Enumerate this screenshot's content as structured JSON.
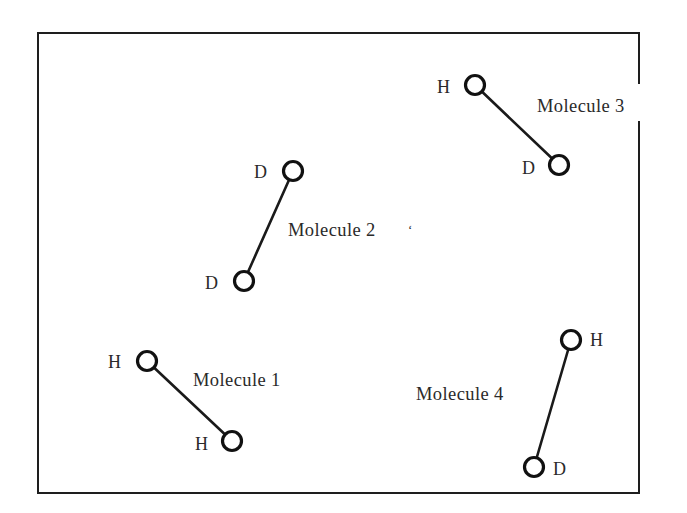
{
  "diagram": {
    "type": "molecules-in-container",
    "colors": {
      "line": "#1e1e1e",
      "text": "#2a2a2a",
      "background": "#ffffff"
    },
    "molecules": [
      {
        "label": "Molecule 1",
        "atoms": [
          {
            "symbol": "H"
          },
          {
            "symbol": "H"
          }
        ]
      },
      {
        "label": "Molecule 2",
        "label_mark": "‘",
        "atoms": [
          {
            "symbol": "D"
          },
          {
            "symbol": "D"
          }
        ]
      },
      {
        "label": "Molecule 3",
        "atoms": [
          {
            "symbol": "H"
          },
          {
            "symbol": "D"
          }
        ]
      },
      {
        "label": "Molecule 4",
        "atoms": [
          {
            "symbol": "H"
          },
          {
            "symbol": "D"
          }
        ]
      }
    ]
  }
}
